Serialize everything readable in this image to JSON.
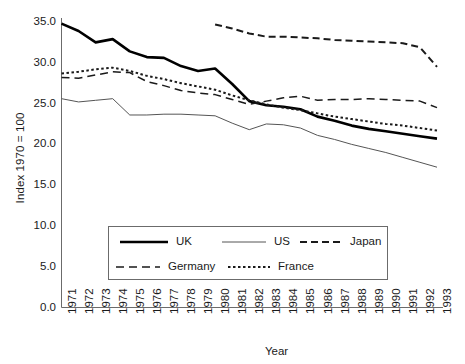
{
  "chart_data": {
    "type": "line",
    "title": "",
    "xlabel": "Year",
    "ylabel": "Index 1970 = 100",
    "xlim": [
      1971,
      1993
    ],
    "ylim": [
      0.0,
      35.0
    ],
    "ytick_step": 5.0,
    "grid": false,
    "legend_position": "lower-center-inside",
    "ytick_labels": [
      "35.0",
      "30.0",
      "25.0",
      "20.0",
      "15.0",
      "10.0",
      "5.0",
      "0.0"
    ],
    "ytick_values": [
      35.0,
      30.0,
      25.0,
      20.0,
      15.0,
      10.0,
      5.0,
      0.0
    ],
    "categories": [
      "1971",
      "1972",
      "1973",
      "1974",
      "1975",
      "1976",
      "1977",
      "1978",
      "1979",
      "1980",
      "1981",
      "1982",
      "1983",
      "1984",
      "1985",
      "1986",
      "1987",
      "1988",
      "1989",
      "1990",
      "1991",
      "1992",
      "1993"
    ],
    "series": [
      {
        "name": "UK",
        "style": "solid-thick",
        "color": "#000000",
        "x": [
          1971,
          1972,
          1973,
          1974,
          1975,
          1976,
          1977,
          1978,
          1979,
          1980,
          1981,
          1982,
          1983,
          1984,
          1985,
          1986,
          1987,
          1988,
          1989,
          1990,
          1991,
          1992,
          1993
        ],
        "values": [
          34.8,
          33.9,
          32.5,
          32.9,
          31.4,
          30.7,
          30.6,
          29.6,
          29.0,
          29.3,
          27.4,
          25.3,
          24.8,
          24.6,
          24.3,
          23.4,
          22.9,
          22.3,
          21.9,
          21.6,
          21.3,
          21.0,
          20.7
        ]
      },
      {
        "name": "US",
        "style": "solid-thin",
        "color": "#555555",
        "x": [
          1971,
          1972,
          1973,
          1974,
          1975,
          1976,
          1977,
          1978,
          1979,
          1980,
          1981,
          1982,
          1983,
          1984,
          1985,
          1986,
          1987,
          1988,
          1989,
          1990,
          1991,
          1992,
          1993
        ],
        "values": [
          25.6,
          25.2,
          25.4,
          25.6,
          23.6,
          23.6,
          23.7,
          23.7,
          23.6,
          23.5,
          22.6,
          21.8,
          22.5,
          22.4,
          22.0,
          21.1,
          20.6,
          20.0,
          19.5,
          19.0,
          18.4,
          17.8,
          17.2
        ]
      },
      {
        "name": "Japan",
        "style": "dashed",
        "color": "#1a1a1a",
        "x": [
          1980,
          1981,
          1982,
          1983,
          1984,
          1985,
          1986,
          1987,
          1988,
          1989,
          1990,
          1991,
          1992,
          1993
        ],
        "values": [
          34.7,
          34.2,
          33.6,
          33.2,
          33.2,
          33.1,
          33.0,
          32.8,
          32.7,
          32.6,
          32.5,
          32.4,
          31.9,
          29.5
        ]
      },
      {
        "name": "Germany",
        "style": "long-dash",
        "color": "#1a1a1a",
        "x": [
          1971,
          1972,
          1973,
          1974,
          1975,
          1976,
          1977,
          1978,
          1979,
          1980,
          1981,
          1982,
          1983,
          1984,
          1985,
          1986,
          1987,
          1988,
          1989,
          1990,
          1991,
          1992,
          1993
        ],
        "values": [
          28.2,
          28.1,
          28.5,
          28.9,
          28.8,
          27.7,
          27.2,
          26.6,
          26.3,
          26.1,
          25.5,
          24.9,
          25.3,
          25.7,
          25.9,
          25.4,
          25.5,
          25.5,
          25.6,
          25.5,
          25.4,
          25.3,
          24.5
        ]
      },
      {
        "name": "France",
        "style": "dotted",
        "color": "#1a1a1a",
        "x": [
          1971,
          1972,
          1973,
          1974,
          1975,
          1976,
          1977,
          1978,
          1979,
          1980,
          1981,
          1982,
          1983,
          1984,
          1985,
          1986,
          1987,
          1988,
          1989,
          1990,
          1991,
          1992,
          1993
        ],
        "values": [
          28.7,
          28.9,
          29.2,
          29.4,
          29.0,
          28.4,
          28.0,
          27.5,
          27.1,
          26.7,
          26.0,
          25.4,
          24.9,
          24.5,
          24.2,
          23.8,
          23.4,
          23.1,
          22.8,
          22.5,
          22.3,
          22.0,
          21.7
        ]
      }
    ]
  },
  "legend": {
    "items": [
      {
        "label": "UK",
        "style": "solid-thick"
      },
      {
        "label": "US",
        "style": "solid-thin"
      },
      {
        "label": "Japan",
        "style": "dashed"
      },
      {
        "label": "Germany",
        "style": "long-dash"
      },
      {
        "label": "France",
        "style": "dotted"
      }
    ]
  }
}
